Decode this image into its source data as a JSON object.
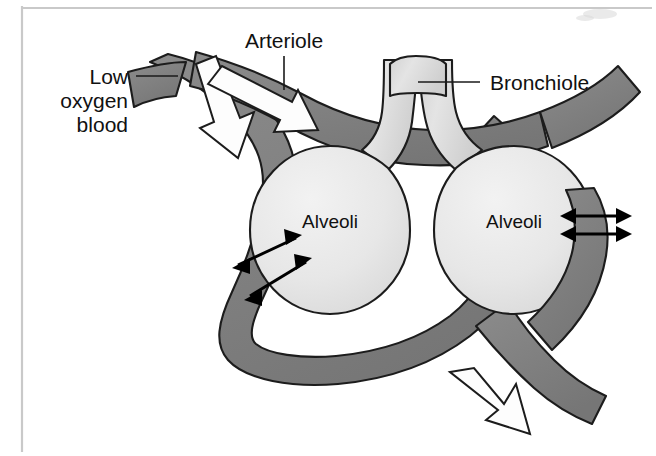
{
  "figure": {
    "background_color": "#ffffff",
    "frame_color": "#c9c9c9",
    "width": 656,
    "height": 456
  },
  "palette": {
    "vessel_gray": "#808080",
    "vessel_gray_dark": "#6f6f6f",
    "alveoli_light": "#e8e8e8",
    "bronchiole_light": "#dcdcdc",
    "outline_black": "#1c1c1c",
    "arrow_white": "#fdfdfd",
    "text_black": "#111111"
  },
  "labels": [
    {
      "id": "low-oxygen-blood",
      "text_lines": [
        "Low",
        "oxygen",
        "blood"
      ],
      "line1": "Low",
      "line2": "oxygen",
      "line3": "blood",
      "leader": "horizontal"
    },
    {
      "id": "arteriole",
      "text": "Arteriole",
      "leader": "vertical"
    },
    {
      "id": "bronchiole",
      "text": "Bronchiole",
      "leader": "horizontal"
    },
    {
      "id": "alveoli-left",
      "text": "Alveoli"
    },
    {
      "id": "alveoli-right",
      "text": "Alveoli"
    }
  ],
  "structures": {
    "vessel_name": "capillary-vessel",
    "alveolus_left_name": "alveolus-left",
    "alveolus_right_name": "alveolus-right",
    "bronchiole_name": "bronchiole-airway"
  },
  "arrows": {
    "blood_flow": [
      {
        "id": "inflow-down",
        "direction": "down-right",
        "style": "white-block"
      },
      {
        "id": "inflow-right",
        "direction": "right",
        "style": "white-block"
      },
      {
        "id": "outflow-down",
        "direction": "down",
        "style": "white-block"
      }
    ],
    "diffusion": [
      {
        "id": "diffusion-left-upper",
        "orientation": "diagonal",
        "double_headed": true
      },
      {
        "id": "diffusion-left-lower",
        "orientation": "diagonal",
        "double_headed": true
      },
      {
        "id": "diffusion-right-upper",
        "orientation": "horizontal",
        "double_headed": true
      },
      {
        "id": "diffusion-right-lower",
        "orientation": "horizontal",
        "double_headed": true
      }
    ]
  }
}
